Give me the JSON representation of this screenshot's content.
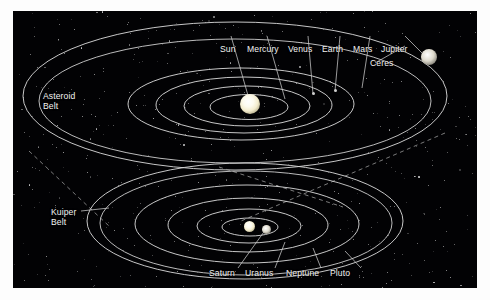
{
  "figure": {
    "background_color": "#020204",
    "orbit_color": "#d8d8d8",
    "label_color": "#f2f2f2",
    "page_background": "#fdfdfd"
  },
  "upper_view": {
    "name": "inner-solar-system",
    "sun_label": "Sun",
    "planet_labels": [
      "Mercury",
      "Venus",
      "Earth",
      "Mars",
      "Jupiter"
    ],
    "belt_label_line1": "Asteroid",
    "belt_label_line2": "Belt",
    "dwarf_label": "Ceres"
  },
  "lower_view": {
    "name": "outer-solar-system",
    "belt_label_line1": "Kuiper",
    "belt_label_line2": "Belt",
    "planet_labels": [
      "Saturn",
      "Uranus",
      "Neptune",
      "Pluto"
    ]
  },
  "labels": {
    "sun": "Sun",
    "mercury": "Mercury",
    "venus": "Venus",
    "earth": "Earth",
    "mars": "Mars",
    "jupiter": "Jupiter",
    "ceres": "Ceres",
    "asteroid_1": "Asteroid",
    "asteroid_2": "Belt",
    "kuiper_1": "Kuiper",
    "kuiper_2": "Belt",
    "saturn": "Saturn",
    "uranus": "Uranus",
    "neptune": "Neptune",
    "pluto": "Pluto"
  }
}
